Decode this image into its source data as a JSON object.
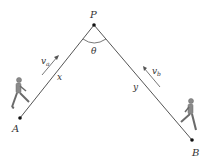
{
  "diagram": {
    "points": {
      "P": {
        "label": "P",
        "x": 94,
        "y": 25
      },
      "A": {
        "label": "A",
        "x": 20,
        "y": 118
      },
      "B": {
        "label": "B",
        "x": 192,
        "y": 140
      }
    },
    "angle_label": "θ",
    "segments": {
      "AP": {
        "label": "x"
      },
      "BP": {
        "label": "y"
      }
    },
    "velocities": {
      "a": {
        "symbol": "v",
        "subscript": "a"
      },
      "b": {
        "symbol": "v",
        "subscript": "b"
      }
    },
    "figures": [
      "walker-left",
      "walker-right"
    ],
    "colors": {
      "line": "#555555",
      "text": "#333333",
      "figure": "#8a8a8a"
    }
  }
}
